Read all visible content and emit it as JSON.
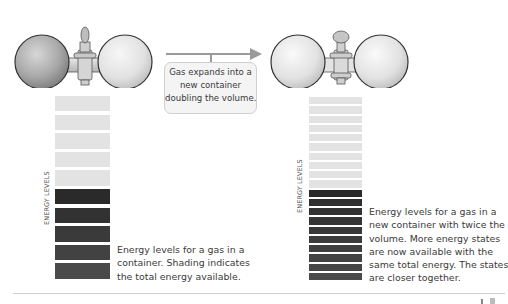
{
  "arrow_callout": {
    "lines": [
      "Gas expands into a",
      "new container",
      "doubling the volume."
    ]
  },
  "left_panel": {
    "axis_label": "ENERGY LEVELS",
    "light_bar_count": 5,
    "dark_bar_count": 5,
    "caption_lines": [
      "Energy levels for a gas in a",
      "container. Shading indicates",
      "the total energy available."
    ]
  },
  "right_panel": {
    "axis_label": "ENERGY LEVELS",
    "light_bar_count": 10,
    "dark_bar_count": 10,
    "caption_lines": [
      "Energy levels for a gas in a",
      "new container with twice the",
      "volume. More energy states",
      "are now available with the",
      "same total energy. The states",
      "are closer together."
    ]
  },
  "colors": {
    "light_bar": "#e3e3e3",
    "dark_bar_top": "#2a2a2a",
    "dark_bar_bottom": "#4a4a4a",
    "arrow": "#9a9a9a"
  }
}
